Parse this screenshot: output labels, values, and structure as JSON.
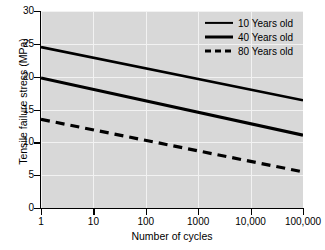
{
  "chart_data": {
    "type": "line",
    "title": "",
    "xlabel": "Number of cycles",
    "ylabel": "Tensile failure stress (MPa)",
    "x_scale": "log",
    "xlim": [
      1,
      100000
    ],
    "ylim": [
      0,
      30
    ],
    "grid": true,
    "legend_position": "top-right",
    "x_ticks": [
      1,
      10,
      100,
      1000,
      10000,
      100000
    ],
    "x_tick_labels": [
      "1",
      "10",
      "100",
      "1000",
      "10,000",
      "100,000"
    ],
    "y_ticks": [
      0,
      5,
      10,
      15,
      20,
      25,
      30
    ],
    "y_tick_labels": [
      "0",
      "5",
      "10",
      "15",
      "20",
      "25",
      "30"
    ],
    "x": [
      1,
      100000
    ],
    "series": [
      {
        "name": "10 Years old",
        "style": "solid",
        "values": [
          24.5,
          16.4
        ]
      },
      {
        "name": "40 Years old",
        "style": "solid",
        "values": [
          19.8,
          11.1
        ]
      },
      {
        "name": "80 Years old",
        "style": "dashed",
        "values": [
          13.5,
          5.5
        ]
      }
    ],
    "colors": {
      "line": "#000000",
      "plot_background": "#d8d8d8",
      "gridline": "#f2f2f2",
      "figure_background": "#ffffff",
      "axis": "#000000"
    }
  }
}
